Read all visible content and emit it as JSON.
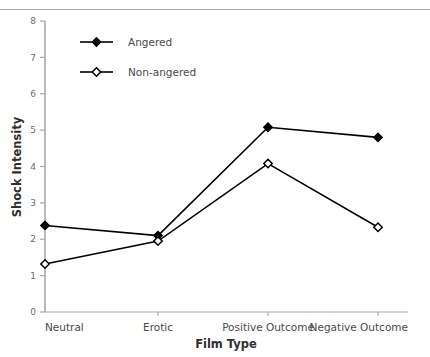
{
  "figure": {
    "cut_caption": "",
    "plot_area": {
      "x": 45,
      "y": 21,
      "w": 363,
      "h": 291
    }
  },
  "chart_data": {
    "type": "line",
    "title": "",
    "subtitle": "",
    "xlabel": "Film Type",
    "ylabel": "Shock Intensity",
    "categories": [
      "Neutral",
      "Erotic",
      "Positive Outcome",
      "Negative Outcome"
    ],
    "yticks": [
      "0",
      "1",
      "2",
      "3",
      "4",
      "5",
      "6",
      "7",
      "8"
    ],
    "ylim": [
      0,
      8
    ],
    "grid": false,
    "legend_position": "upper-left-inside",
    "series": [
      {
        "name": "Angered",
        "marker": "filled-diamond",
        "color": "#000000",
        "values": [
          2.38,
          2.1,
          5.08,
          4.8
        ]
      },
      {
        "name": "Non-angered",
        "marker": "open-diamond",
        "color": "#000000",
        "values": [
          1.32,
          1.95,
          4.08,
          2.33
        ]
      }
    ]
  },
  "legend": {
    "entries": [
      {
        "label": "Angered"
      },
      {
        "label": "Non-angered"
      }
    ]
  }
}
